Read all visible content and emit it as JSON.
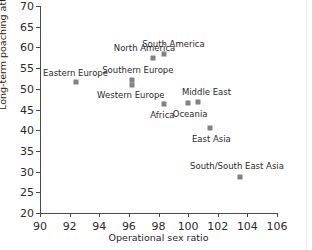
{
  "chart_data": {
    "type": "scatter",
    "title": "",
    "xlabel": "Operational sex ratio",
    "ylabel": "Long-term poaching attempted (%)",
    "xlim": [
      90,
      106
    ],
    "ylim": [
      20,
      70
    ],
    "xticks": [
      90,
      92,
      94,
      96,
      98,
      100,
      102,
      104,
      106
    ],
    "yticks": [
      20,
      25,
      30,
      35,
      40,
      45,
      50,
      55,
      60,
      65,
      70
    ],
    "grid": false,
    "legend": "none",
    "marker_color": "#828282",
    "axis_color": "#4a4a4a",
    "points": [
      {
        "label": "Eastern Europe",
        "x": 92.4,
        "y": 51.6,
        "label_dx": 0,
        "label_dy": -9
      },
      {
        "label": "Southern Europe",
        "x": 96.2,
        "y": 52.1,
        "label_dx": 6,
        "label_dy": -10
      },
      {
        "label": "Western Europe",
        "x": 96.2,
        "y": 51.0,
        "label_dx": -1,
        "label_dy": 10
      },
      {
        "label": "North America",
        "x": 97.6,
        "y": 57.4,
        "label_dx": -8,
        "label_dy": -10
      },
      {
        "label": "South America",
        "x": 98.4,
        "y": 58.4,
        "label_dx": 9,
        "label_dy": -10
      },
      {
        "label": "Africa",
        "x": 98.4,
        "y": 46.3,
        "label_dx": -2,
        "label_dy": 11
      },
      {
        "label": "Oceania",
        "x": 100.0,
        "y": 46.5,
        "label_dx": 2,
        "label_dy": 11
      },
      {
        "label": "Middle East",
        "x": 100.7,
        "y": 46.9,
        "label_dx": 8,
        "label_dy": -10
      },
      {
        "label": "East Asia",
        "x": 101.5,
        "y": 40.6,
        "label_dx": 1,
        "label_dy": 11
      },
      {
        "label": "South/South East Asia",
        "x": 103.5,
        "y": 28.6,
        "label_dx": -3,
        "label_dy": -11
      }
    ]
  }
}
